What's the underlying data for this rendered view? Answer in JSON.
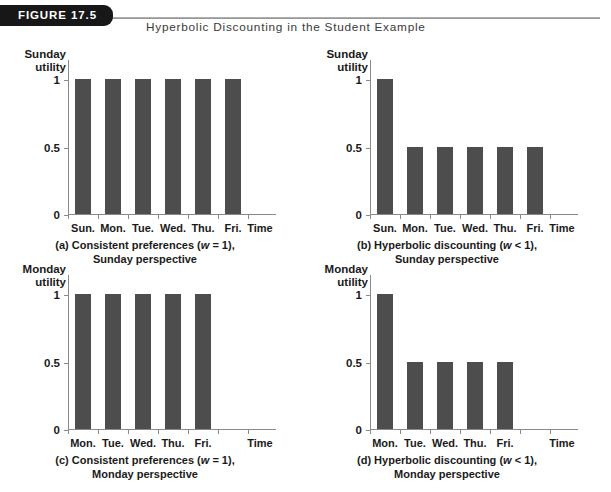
{
  "header": {
    "tag_label": "FIGURE 17.5",
    "title": "Hyperbolic Discounting in the Student Example",
    "tag_color": "#171717",
    "rule_color": "#8d8d8d"
  },
  "common": {
    "y_ticks": [
      "0",
      "0.5",
      "1"
    ],
    "time_axis_label": "Time",
    "bar_color": "#4d4d4d",
    "axis_color": "#8a8a8a"
  },
  "chart_data": [
    {
      "id": "a",
      "type": "bar",
      "title": "",
      "ylabel": "Sunday utility",
      "ylabel_lines": [
        "Sunday",
        "utility"
      ],
      "xlabel": "Time",
      "categories": [
        "Sun.",
        "Mon.",
        "Tue.",
        "Wed.",
        "Thu.",
        "Fri."
      ],
      "values": [
        1,
        1,
        1,
        1,
        1,
        1
      ],
      "ylim": [
        0,
        1.15
      ],
      "yticks": [
        0,
        0.5,
        1
      ],
      "ytick_labels": [
        "0",
        "0.5",
        "1"
      ],
      "grid": false,
      "legend": "none",
      "caption_line1": "(a) Consistent preferences (w = 1),",
      "caption_line2": "Sunday perspective",
      "caption_parts": {
        "pre": "(a) Consistent preferences (",
        "italic": "w",
        "post": " = 1),"
      }
    },
    {
      "id": "b",
      "type": "bar",
      "title": "",
      "ylabel": "Sunday utility",
      "ylabel_lines": [
        "Sunday",
        "utility"
      ],
      "xlabel": "Time",
      "categories": [
        "Sun.",
        "Mon.",
        "Tue.",
        "Wed.",
        "Thu.",
        "Fri."
      ],
      "values": [
        1,
        0.5,
        0.5,
        0.5,
        0.5,
        0.5
      ],
      "ylim": [
        0,
        1.15
      ],
      "yticks": [
        0,
        0.5,
        1
      ],
      "ytick_labels": [
        "0",
        "0.5",
        "1"
      ],
      "grid": false,
      "legend": "none",
      "caption_line1": "(b) Hyperbolic discounting (w < 1),",
      "caption_line2": "Sunday perspective",
      "caption_parts": {
        "pre": "(b) Hyperbolic discounting (",
        "italic": "w",
        "post": " < 1),"
      }
    },
    {
      "id": "c",
      "type": "bar",
      "title": "",
      "ylabel": "Monday utility",
      "ylabel_lines": [
        "Monday",
        "utility"
      ],
      "xlabel": "Time",
      "categories": [
        "Mon.",
        "Tue.",
        "Wed.",
        "Thu.",
        "Fri."
      ],
      "values": [
        1,
        1,
        1,
        1,
        1
      ],
      "ylim": [
        0,
        1.15
      ],
      "yticks": [
        0,
        0.5,
        1
      ],
      "ytick_labels": [
        "0",
        "0.5",
        "1"
      ],
      "grid": false,
      "legend": "none",
      "caption_line1": "(c) Consistent preferences (w = 1),",
      "caption_line2": "Monday perspective",
      "caption_parts": {
        "pre": "(c) Consistent preferences (",
        "italic": "w",
        "post": " = 1),"
      }
    },
    {
      "id": "d",
      "type": "bar",
      "title": "",
      "ylabel": "Monday utility",
      "ylabel_lines": [
        "Monday",
        "utility"
      ],
      "xlabel": "Time",
      "categories": [
        "Mon.",
        "Tue.",
        "Wed.",
        "Thu.",
        "Fri."
      ],
      "values": [
        1,
        0.5,
        0.5,
        0.5,
        0.5
      ],
      "ylim": [
        0,
        1.15
      ],
      "yticks": [
        0,
        0.5,
        1
      ],
      "ytick_labels": [
        "0",
        "0.5",
        "1"
      ],
      "grid": false,
      "legend": "none",
      "caption_line1": "(d) Hyperbolic discounting (w < 1),",
      "caption_line2": "Monday perspective",
      "caption_parts": {
        "pre": "(d) Hyperbolic discounting (",
        "italic": "w",
        "post": " < 1),"
      }
    }
  ]
}
